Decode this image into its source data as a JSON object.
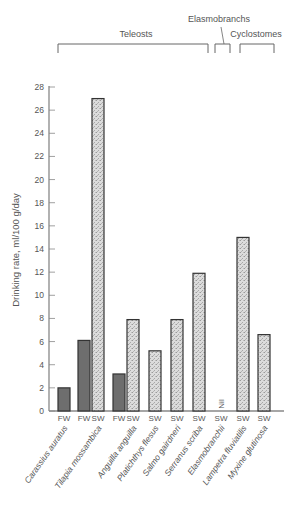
{
  "chart_data": {
    "type": "bar",
    "title": "",
    "xlabel": "",
    "ylabel": "Drinking rate, ml/100 g/day",
    "ylim": [
      0,
      28
    ],
    "yticks": [
      0,
      2,
      4,
      6,
      8,
      10,
      12,
      14,
      16,
      18,
      20,
      22,
      24,
      26,
      28
    ],
    "grid": false,
    "legend": "none (FW = freshwater, dark bars; SW = seawater, stippled bars)",
    "groups": [
      {
        "label": "Teleosts",
        "species": [
          "Carassius auratus",
          "Tilapia mossambica",
          "Anguilla anguilla",
          "Platichthys flesus",
          "Salmo gairdneri",
          "Serranus scriba"
        ]
      },
      {
        "label": "Elasmobranchs",
        "species": [
          "Elasmobranchii"
        ]
      },
      {
        "label": "Cyclostomes",
        "species": [
          "Lampetra fluviatilis",
          "Myxine glutinosa"
        ]
      }
    ],
    "categories": [
      "Carassius auratus",
      "Tilapia mossambica",
      "Anguilla anguilla",
      "Platichthys flesus",
      "Salmo gairdneri",
      "Serranus scriba",
      "Elasmobranchii",
      "Lampetra fluviatilis",
      "Myxine glutinosa"
    ],
    "bars": [
      {
        "species": "Carassius auratus",
        "medium": "FW",
        "value": 2.0,
        "x": 58
      },
      {
        "species": "Tilapia mossambica",
        "medium": "FW",
        "value": 6.1,
        "x": 78
      },
      {
        "species": "Tilapia mossambica",
        "medium": "SW",
        "value": 27.0,
        "x": 92
      },
      {
        "species": "Anguilla anguilla",
        "medium": "FW",
        "value": 3.2,
        "x": 113
      },
      {
        "species": "Anguilla anguilla",
        "medium": "SW",
        "value": 7.9,
        "x": 127
      },
      {
        "species": "Platichthys flesus",
        "medium": "SW",
        "value": 5.2,
        "x": 149
      },
      {
        "species": "Salmo gairdneri",
        "medium": "SW",
        "value": 7.9,
        "x": 171
      },
      {
        "species": "Serranus scriba",
        "medium": "SW",
        "value": 11.9,
        "x": 193
      },
      {
        "species": "Elasmobranchii",
        "medium": "SW",
        "value": 0,
        "x": 215,
        "annotation": "Nil"
      },
      {
        "species": "Lampetra fluviatilis",
        "medium": "SW",
        "value": 15.0,
        "x": 237
      },
      {
        "species": "Myxine glutinosa",
        "medium": "SW",
        "value": 6.6,
        "x": 258
      }
    ],
    "series": [
      {
        "name": "FW",
        "values": [
          2.0,
          6.1,
          3.2,
          null,
          null,
          null,
          null,
          null,
          null
        ]
      },
      {
        "name": "SW",
        "values": [
          null,
          27.0,
          7.9,
          5.2,
          7.9,
          11.9,
          0,
          15.0,
          6.6
        ]
      }
    ],
    "annotations": [
      "Nil"
    ]
  },
  "colors": {
    "fw": "#6e6e6e",
    "sw": "#d9d9d9",
    "axis": "#888888",
    "outline": "#333333"
  }
}
